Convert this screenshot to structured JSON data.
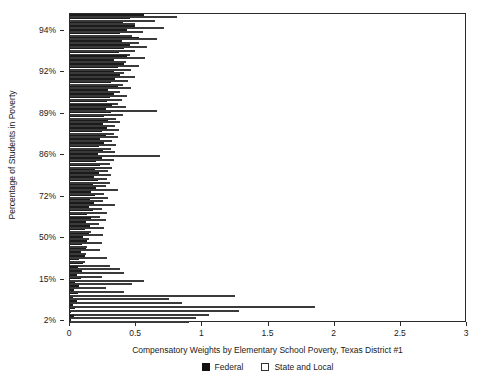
{
  "chart_data": {
    "type": "bar",
    "orientation": "horizontal",
    "title": "",
    "xlabel": "Compensatory Weights by Elementary School Poverty, Texas District #1",
    "ylabel": "Percentage of Students in Poverty",
    "xlim": [
      0,
      3
    ],
    "ylim_note": "schools ordered by poverty, highest poverty at top",
    "grid": false,
    "legend_position": "below-axis-center",
    "x_ticks": [
      {
        "value": 0,
        "label": "0"
      },
      {
        "value": 0.5,
        "label": "0.5"
      },
      {
        "value": 1,
        "label": "1"
      },
      {
        "value": 1.5,
        "label": "1.5"
      },
      {
        "value": 2,
        "label": "2"
      },
      {
        "value": 2.5,
        "label": "2.5"
      },
      {
        "value": 3,
        "label": "3"
      }
    ],
    "y_ticks": [
      {
        "label": "94%",
        "index": 4
      },
      {
        "label": "92%",
        "index": 15
      },
      {
        "label": "89%",
        "index": 26
      },
      {
        "label": "86%",
        "index": 37
      },
      {
        "label": "72%",
        "index": 48
      },
      {
        "label": "50%",
        "index": 59
      },
      {
        "label": "15%",
        "index": 70
      },
      {
        "label": "2%",
        "index": 81
      }
    ],
    "series": [
      {
        "name": "Federal",
        "color": "#1b1b1b",
        "values": [
          0.56,
          0.45,
          0.4,
          0.49,
          0.43,
          0.38,
          0.52,
          0.39,
          0.45,
          0.41,
          0.37,
          0.43,
          0.33,
          0.41,
          0.36,
          0.33,
          0.38,
          0.34,
          0.31,
          0.36,
          0.29,
          0.33,
          0.3,
          0.28,
          0.32,
          0.27,
          0.31,
          0.26,
          0.29,
          0.25,
          0.28,
          0.24,
          0.27,
          0.23,
          0.26,
          0.22,
          0.25,
          0.21,
          0.24,
          0.2,
          0.23,
          0.19,
          0.22,
          0.18,
          0.21,
          0.17,
          0.2,
          0.16,
          0.19,
          0.15,
          0.18,
          0.14,
          0.17,
          0.13,
          0.16,
          0.12,
          0.15,
          0.11,
          0.14,
          0.1,
          0.13,
          0.09,
          0.12,
          0.08,
          0.11,
          0.07,
          0.1,
          0.06,
          0.09,
          0.05,
          0.08,
          0.04,
          0.07,
          0.03,
          0.06,
          0.02,
          0.05,
          0.02,
          0.04,
          0.01,
          0.03,
          0.01
        ]
      },
      {
        "name": "State and Local",
        "color": "#ffffff",
        "values": [
          0.81,
          0.64,
          0.49,
          0.71,
          0.55,
          0.47,
          0.66,
          0.52,
          0.58,
          0.49,
          0.45,
          0.57,
          0.42,
          0.52,
          0.46,
          0.41,
          0.49,
          0.44,
          0.4,
          0.46,
          0.38,
          0.43,
          0.39,
          0.36,
          0.42,
          0.66,
          0.4,
          0.35,
          0.38,
          0.34,
          0.37,
          0.33,
          0.36,
          0.32,
          0.35,
          0.31,
          0.34,
          0.68,
          0.33,
          0.3,
          0.32,
          0.29,
          0.31,
          0.28,
          0.3,
          0.27,
          0.36,
          0.26,
          0.29,
          0.25,
          0.34,
          0.24,
          0.28,
          0.23,
          0.27,
          0.22,
          0.26,
          0.16,
          0.25,
          0.14,
          0.24,
          0.13,
          0.23,
          0.12,
          0.28,
          0.11,
          0.3,
          0.38,
          0.41,
          0.24,
          0.56,
          0.47,
          0.27,
          0.41,
          1.25,
          0.75,
          0.85,
          1.85,
          1.28,
          1.05,
          0.95,
          0.9
        ]
      }
    ]
  },
  "legend": {
    "entries": [
      {
        "label": "Federal",
        "swatch": "filled-black-square"
      },
      {
        "label": "State and Local",
        "swatch": "outlined-white-square"
      }
    ]
  },
  "axes": {
    "x_title": "Compensatory Weights by Elementary School Poverty, Texas District #1",
    "y_title": "Percentage of Students in Poverty"
  },
  "colors": {
    "federal": "#1b1b1b",
    "state_and_local": "#ffffff",
    "frame": "#2b2b2b",
    "background": "#ffffff"
  }
}
